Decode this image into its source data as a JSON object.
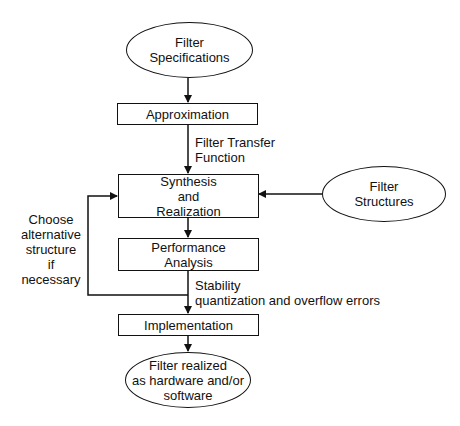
{
  "diagram": {
    "type": "flowchart",
    "nodes": {
      "filter_specifications": {
        "shape": "ellipse",
        "text": "Filter\nSpecifications"
      },
      "approximation": {
        "shape": "rectangle",
        "text": "Approximation"
      },
      "synthesis": {
        "shape": "rectangle",
        "text": "Synthesis\nand\nRealization"
      },
      "filter_structures": {
        "shape": "ellipse",
        "text": "Filter\nStructures"
      },
      "performance": {
        "shape": "rectangle",
        "text": "Performance\nAnalysis"
      },
      "implementation": {
        "shape": "rectangle",
        "text": "Implementation"
      },
      "filter_realized": {
        "shape": "ellipse",
        "text": "Filter realized\nas hardware and/or\nsoftware"
      }
    },
    "edge_labels": {
      "transfer_function": "Filter Transfer\nFunction",
      "feedback": "Choose\nalternative\nstructure\nif\nnecessary",
      "stability": "Stability\nquantization and overflow errors"
    },
    "edges": [
      {
        "from": "filter_specifications",
        "to": "approximation"
      },
      {
        "from": "approximation",
        "to": "synthesis",
        "label": "Filter Transfer Function"
      },
      {
        "from": "filter_structures",
        "to": "synthesis"
      },
      {
        "from": "synthesis",
        "to": "performance"
      },
      {
        "from": "performance",
        "to": "synthesis",
        "label": "Choose alternative structure if necessary"
      },
      {
        "from": "performance",
        "to": "implementation",
        "label": "Stability quantization and overflow errors"
      },
      {
        "from": "implementation",
        "to": "filter_realized"
      }
    ],
    "stroke_color": "#111111",
    "background": "#ffffff"
  }
}
